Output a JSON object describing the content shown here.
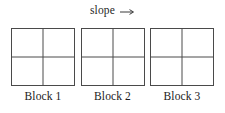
{
  "figure": {
    "type": "diagram",
    "header": {
      "label": "slope",
      "arrow_icon": "arrow-right-icon",
      "arrow_glyph": "→",
      "direction": "right"
    },
    "line_color": "#4a4a4a",
    "background_color": "#ffffff",
    "text_color": "#1a1a1a",
    "blocks": [
      {
        "caption": "Block 1",
        "rows": 2,
        "columns": 2,
        "cells": [
          "",
          "",
          "",
          ""
        ]
      },
      {
        "caption": "Block 2",
        "rows": 2,
        "columns": 2,
        "cells": [
          "",
          "",
          "",
          ""
        ]
      },
      {
        "caption": "Block 3",
        "rows": 2,
        "columns": 2,
        "cells": [
          "",
          "",
          "",
          ""
        ]
      }
    ]
  }
}
